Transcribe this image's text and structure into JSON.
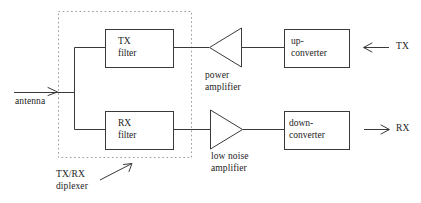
{
  "diagram": {
    "colors": {
      "line": "#3a3a3a",
      "dotted": "#9a9a9a",
      "text": "#1c1c1c",
      "background": "#ffffff"
    },
    "blocks": {
      "tx_filter": {
        "line1": "TX",
        "line2": "filter"
      },
      "rx_filter": {
        "line1": "RX",
        "line2": "filter"
      },
      "up_converter": {
        "line1": "up-",
        "line2": "converter"
      },
      "down_converter": {
        "line1": "down-",
        "line2": "converter"
      }
    },
    "amplifiers": {
      "power_amplifier": {
        "line1": "power",
        "line2": "amplifier"
      },
      "low_noise_amplifier": {
        "line1": "low noise",
        "line2": "amplifier"
      }
    },
    "labels": {
      "antenna": "antenna",
      "diplexer_line1": "TX/RX",
      "diplexer_line2": "diplexer",
      "tx_port": "TX",
      "rx_port": "RX"
    },
    "icons": {
      "antenna_arrow": "arrow-right-icon",
      "tx_arrow": "arrow-left-icon",
      "rx_arrow": "arrow-right-icon",
      "diplexer_pointer": "arrow-diagonal-up-right-icon"
    }
  }
}
